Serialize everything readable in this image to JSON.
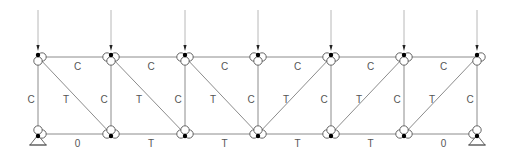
{
  "diagram": {
    "type": "pratt-truss",
    "colors": {
      "member": "#8c8c8c",
      "label": "#555555",
      "joint_dot": "#000000"
    },
    "top_chord_y": 57,
    "bottom_chord_y": 134,
    "joint_x": [
      38,
      111,
      185,
      258,
      331,
      404,
      477
    ],
    "loads": {
      "count": 7,
      "direction": "down",
      "line_top_y": 10,
      "applied_at": "top-joints"
    },
    "supports": [
      {
        "name": "left-support",
        "type": "pin",
        "joint_x": 38
      },
      {
        "name": "right-support",
        "type": "roller",
        "joint_x": 477
      }
    ],
    "top_chord_labels": [
      "C",
      "C",
      "C",
      "C",
      "C",
      "C"
    ],
    "bottom_chord_labels": [
      "0",
      "T",
      "T",
      "T",
      "T",
      "0"
    ],
    "vertical_labels": [
      "C",
      "C",
      "C",
      "C",
      "C",
      "C",
      "C"
    ],
    "diagonal_labels": [
      "T",
      "T",
      "T",
      "T",
      "T",
      "T"
    ],
    "diagonals": [
      {
        "from": [
          0,
          "top"
        ],
        "to": [
          1,
          "bottom"
        ]
      },
      {
        "from": [
          1,
          "top"
        ],
        "to": [
          2,
          "bottom"
        ]
      },
      {
        "from": [
          2,
          "top"
        ],
        "to": [
          3,
          "bottom"
        ]
      },
      {
        "from": [
          3,
          "bottom"
        ],
        "to": [
          4,
          "top"
        ]
      },
      {
        "from": [
          4,
          "bottom"
        ],
        "to": [
          5,
          "top"
        ]
      },
      {
        "from": [
          5,
          "bottom"
        ],
        "to": [
          6,
          "top"
        ]
      }
    ]
  }
}
